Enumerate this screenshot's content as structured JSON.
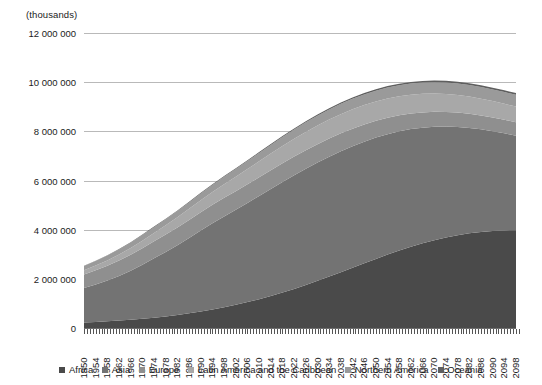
{
  "units_note": "(thousands)",
  "axis": {
    "y_ticks": [
      "12 000 000",
      "10 000 000",
      "8 000 000",
      "6 000 000",
      "4 000 000",
      "2 000 000",
      "0"
    ],
    "x_ticks": [
      "1950",
      "1954",
      "1958",
      "1962",
      "1966",
      "1970",
      "1974",
      "1978",
      "1982",
      "1986",
      "1990",
      "1994",
      "1998",
      "2002",
      "2006",
      "2010",
      "2014",
      "2018",
      "2022",
      "2026",
      "2030",
      "2034",
      "2038",
      "2042",
      "2046",
      "2050",
      "2054",
      "2058",
      "2062",
      "2066",
      "2070",
      "2074",
      "2078",
      "2082",
      "2086",
      "2090",
      "2094",
      "2098"
    ]
  },
  "legend": {
    "items": [
      {
        "label": "Africa",
        "color": "#4a4a4a"
      },
      {
        "label": "Asia",
        "color": "#737373"
      },
      {
        "label": "Europe",
        "color": "#8f8f8f"
      },
      {
        "label": "Latin America and the Caribbean",
        "color": "#a8a8a8"
      },
      {
        "label": "Northern America",
        "color": "#9a9a9a"
      },
      {
        "label": "Oceania",
        "color": "#5f5f5f"
      }
    ]
  },
  "chart_data": {
    "type": "area",
    "title": "",
    "subtitle": "",
    "xlabel": "",
    "ylabel": "(thousands)",
    "ylim": [
      0,
      12000000
    ],
    "ytick_interval": 2000000,
    "grid": true,
    "stacked": true,
    "legend_position": "bottom",
    "x": [
      1950,
      1954,
      1958,
      1962,
      1966,
      1970,
      1974,
      1978,
      1982,
      1986,
      1990,
      1994,
      1998,
      2002,
      2006,
      2010,
      2014,
      2018,
      2022,
      2026,
      2030,
      2034,
      2038,
      2042,
      2046,
      2050,
      2054,
      2058,
      2062,
      2066,
      2070,
      2074,
      2078,
      2082,
      2086,
      2090,
      2094,
      2098
    ],
    "series": [
      {
        "name": "Africa",
        "color": "#4a4a4a",
        "values": [
          228000,
          249000,
          274000,
          303000,
          337000,
          376000,
          420000,
          470000,
          528000,
          595000,
          672000,
          757000,
          848000,
          946000,
          1053000,
          1170000,
          1300000,
          1440000,
          1590000,
          1750000,
          1918000,
          2092000,
          2270000,
          2450000,
          2630000,
          2810000,
          2985000,
          3150000,
          3305000,
          3445000,
          3570000,
          3680000,
          3775000,
          3850000,
          3905000,
          3945000,
          3970000,
          3980000
        ]
      },
      {
        "name": "Asia",
        "color": "#737373",
        "values": [
          1404000,
          1525000,
          1660000,
          1815000,
          1995000,
          2200000,
          2415000,
          2625000,
          2840000,
          3065000,
          3290000,
          3500000,
          3690000,
          3865000,
          4035000,
          4200000,
          4355000,
          4495000,
          4620000,
          4725000,
          4810000,
          4875000,
          4920000,
          4945000,
          4950000,
          4935000,
          4900000,
          4850000,
          4785000,
          4705000,
          4615000,
          4515000,
          4405000,
          4290000,
          4175000,
          4060000,
          3950000,
          3845000
        ]
      },
      {
        "name": "Europe",
        "color": "#8f8f8f",
        "values": [
          549000,
          575000,
          601000,
          627000,
          651000,
          673000,
          692000,
          709000,
          724000,
          737000,
          748000,
          755000,
          757000,
          756000,
          757000,
          760000,
          763000,
          764000,
          762000,
          757000,
          749000,
          739000,
          727000,
          713000,
          698000,
          682000,
          666000,
          650000,
          635000,
          621000,
          608000,
          596000,
          585000,
          575000,
          566000,
          558000,
          551000,
          545000
        ]
      },
      {
        "name": "Latin America and the Caribbean",
        "color": "#a8a8a8",
        "values": [
          169000,
          191000,
          215000,
          242000,
          272000,
          305000,
          340000,
          376000,
          413000,
          450000,
          486000,
          521000,
          555000,
          588000,
          620000,
          650000,
          678000,
          703000,
          726000,
          745000,
          761000,
          773000,
          782000,
          787000,
          789000,
          788000,
          784000,
          777000,
          768000,
          757000,
          744000,
          730000,
          715000,
          699000,
          683000,
          667000,
          651000,
          636000
        ]
      },
      {
        "name": "Northern America",
        "color": "#9a9a9a",
        "values": [
          172000,
          184000,
          196000,
          207000,
          217000,
          227000,
          236000,
          244000,
          253000,
          263000,
          274000,
          286000,
          299000,
          312000,
          325000,
          339000,
          353000,
          366000,
          378000,
          389000,
          400000,
          409000,
          418000,
          426000,
          433000,
          440000,
          446000,
          451000,
          456000,
          460000,
          464000,
          467000,
          470000,
          472000,
          474000,
          476000,
          477000,
          478000
        ]
      },
      {
        "name": "Oceania",
        "color": "#5f5f5f",
        "values": [
          13000,
          14000,
          15000,
          17000,
          18000,
          20000,
          21000,
          23000,
          24000,
          26000,
          27000,
          29000,
          31000,
          33000,
          35000,
          37000,
          39000,
          41000,
          43000,
          45000,
          47000,
          49000,
          51000,
          53000,
          55000,
          57000,
          58000,
          60000,
          61000,
          63000,
          64000,
          65000,
          66000,
          67000,
          68000,
          69000,
          70000,
          71000
        ]
      }
    ]
  }
}
